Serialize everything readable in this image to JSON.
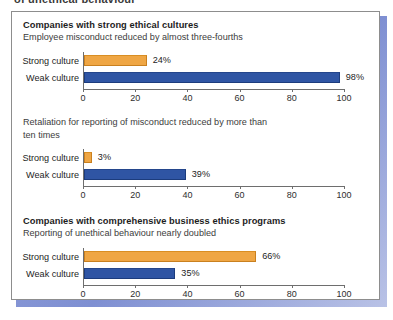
{
  "top_caption": "of unethical behaviour",
  "axis": {
    "ticks": [
      0,
      20,
      40,
      60,
      80,
      100
    ],
    "min": 0,
    "max": 100
  },
  "colors": {
    "strong_culture_bar": "#efa644",
    "weak_culture_bar": "#2f55a4",
    "panel_border": "#8d8d8d",
    "panel_shadow": "#7e8fd2"
  },
  "chart_data": [
    {
      "type": "bar",
      "orientation": "horizontal",
      "title": "Companies with strong ethical cultures",
      "subtitle": "Employee misconduct reduced by almost three-fourths",
      "categories": [
        "Strong culture",
        "Weak culture"
      ],
      "values": [
        24,
        98
      ],
      "value_labels": [
        "24%",
        "98%"
      ],
      "xlabel": "",
      "ylabel": "",
      "xlim": [
        0,
        100
      ],
      "xticks": [
        0,
        20,
        40,
        60,
        80,
        100
      ],
      "grid": false,
      "legend": "none"
    },
    {
      "type": "bar",
      "orientation": "horizontal",
      "title": "",
      "subtitle": "Retaliation for reporting of misconduct reduced by more than ten times",
      "categories": [
        "Strong culture",
        "Weak culture"
      ],
      "values": [
        3,
        39
      ],
      "value_labels": [
        "3%",
        "39%"
      ],
      "xlabel": "",
      "ylabel": "",
      "xlim": [
        0,
        100
      ],
      "xticks": [
        0,
        20,
        40,
        60,
        80,
        100
      ],
      "grid": false,
      "legend": "none"
    },
    {
      "type": "bar",
      "orientation": "horizontal",
      "title": "Companies with comprehensive business ethics programs",
      "subtitle": "Reporting of unethical behaviour nearly doubled",
      "categories": [
        "Strong culture",
        "Weak culture"
      ],
      "values": [
        66,
        35
      ],
      "value_labels": [
        "66%",
        "35%"
      ],
      "xlabel": "",
      "ylabel": "",
      "xlim": [
        0,
        100
      ],
      "xticks": [
        0,
        20,
        40,
        60,
        80,
        100
      ],
      "grid": false,
      "legend": "none"
    }
  ]
}
